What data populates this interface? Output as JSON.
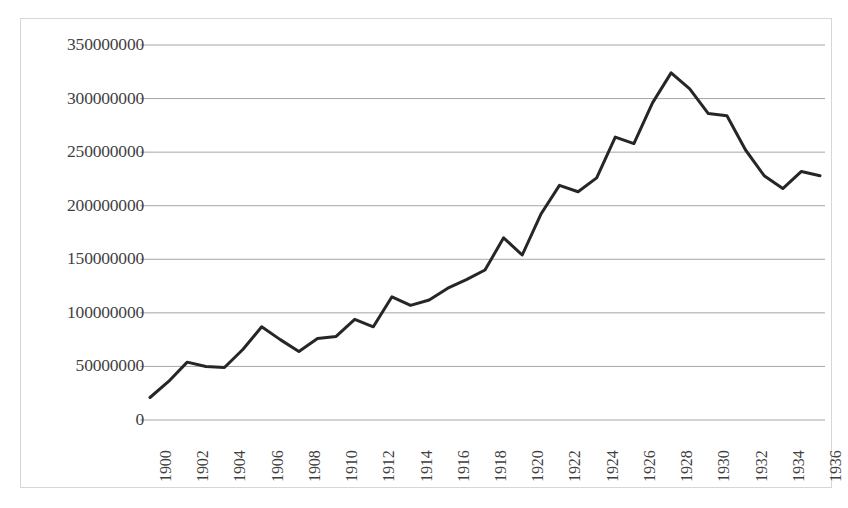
{
  "chart_data": {
    "type": "line",
    "title": "",
    "xlabel": "",
    "ylabel": "",
    "x": [
      1900,
      1901,
      1902,
      1903,
      1904,
      1905,
      1906,
      1907,
      1908,
      1909,
      1910,
      1911,
      1912,
      1913,
      1914,
      1915,
      1916,
      1917,
      1918,
      1919,
      1920,
      1921,
      1922,
      1923,
      1924,
      1925,
      1926,
      1927,
      1928,
      1929,
      1930,
      1931,
      1932,
      1933,
      1934,
      1935,
      1936
    ],
    "values": [
      21000000,
      36000000,
      54000000,
      50000000,
      49000000,
      66000000,
      87000000,
      75000000,
      64000000,
      76000000,
      78000000,
      94000000,
      87000000,
      115000000,
      107000000,
      112000000,
      123000000,
      131000000,
      140000000,
      170000000,
      154000000,
      192000000,
      219000000,
      213000000,
      226000000,
      264000000,
      258000000,
      296000000,
      324000000,
      309000000,
      286000000,
      284000000,
      252000000,
      228000000,
      216000000,
      232000000,
      228000000
    ],
    "xlim": [
      1900,
      1936
    ],
    "ylim": [
      0,
      350000000
    ],
    "ytick_labels": [
      "0",
      "50000000",
      "100000000",
      "150000000",
      "200000000",
      "250000000",
      "300000000",
      "350000000"
    ],
    "ytick_values": [
      0,
      50000000,
      100000000,
      150000000,
      200000000,
      250000000,
      300000000,
      350000000
    ],
    "xtick_labels": [
      "1900",
      "1902",
      "1904",
      "1906",
      "1908",
      "1910",
      "1912",
      "1914",
      "1916",
      "1918",
      "1920",
      "1922",
      "1924",
      "1926",
      "1928",
      "1930",
      "1932",
      "1934",
      "1936"
    ],
    "xtick_values": [
      1900,
      1902,
      1904,
      1906,
      1908,
      1910,
      1912,
      1914,
      1916,
      1918,
      1920,
      1922,
      1924,
      1926,
      1928,
      1930,
      1932,
      1934,
      1936
    ],
    "grid": true,
    "grid_axis": "y",
    "legend": false,
    "legend_position": "none",
    "series_color": "#262626",
    "grid_color": "#a6a6a6",
    "border_color": "#d6d6d6",
    "line_width": 3,
    "markers": false
  }
}
